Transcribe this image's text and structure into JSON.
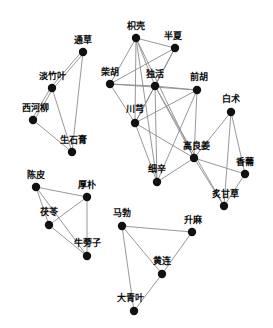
{
  "chart_data": {
    "type": "network-graph",
    "title": "",
    "xlabel": "",
    "ylabel": "",
    "grid": false,
    "legend": "none",
    "node_color": "#111111",
    "edge_color": "#8c8c8c",
    "background": "#ffffff",
    "node_radius": 4.2,
    "xlim": [
      0,
      273
    ],
    "ylim": [
      0,
      328
    ],
    "clusters": [
      {
        "name": "cluster-left-top",
        "members": [
          "通草",
          "淡竹叶",
          "西河柳",
          "生石膏"
        ]
      },
      {
        "name": "cluster-center-right",
        "members": [
          "枳壳",
          "半夏",
          "柴胡",
          "独活",
          "前胡",
          "川芎",
          "白术",
          "高良姜",
          "细辛",
          "香薷",
          "炙甘草"
        ]
      },
      {
        "name": "cluster-left-bottom",
        "members": [
          "陈皮",
          "厚朴",
          "茯苓",
          "牛蒡子"
        ]
      },
      {
        "name": "cluster-bottom-right",
        "members": [
          "马勃",
          "升麻",
          "黄连",
          "大青叶"
        ]
      }
    ],
    "nodes": [
      {
        "id": "tongcao",
        "label": "通草",
        "x": 83,
        "y": 52,
        "label_x": 83,
        "label_y": 45
      },
      {
        "id": "danzhuye",
        "label": "淡竹叶",
        "x": 52,
        "y": 88,
        "label_x": 52,
        "label_y": 81
      },
      {
        "id": "xiheliu",
        "label": "西河柳",
        "x": 33,
        "y": 120,
        "label_x": 35,
        "label_y": 113
      },
      {
        "id": "shengshigao",
        "label": "生石膏",
        "x": 72,
        "y": 152,
        "label_x": 73,
        "label_y": 145
      },
      {
        "id": "zhiqiao",
        "label": "枳壳",
        "x": 136,
        "y": 38,
        "label_x": 136,
        "label_y": 31
      },
      {
        "id": "banxia",
        "label": "半夏",
        "x": 175,
        "y": 48,
        "label_x": 173,
        "label_y": 41
      },
      {
        "id": "chaihu",
        "label": "柴胡",
        "x": 110,
        "y": 84,
        "label_x": 110,
        "label_y": 77
      },
      {
        "id": "duhuo",
        "label": "独活",
        "x": 155,
        "y": 86,
        "label_x": 155,
        "label_y": 79
      },
      {
        "id": "qianhu",
        "label": "前胡",
        "x": 197,
        "y": 90,
        "label_x": 199,
        "label_y": 82
      },
      {
        "id": "chuanxiong",
        "label": "川芎",
        "x": 135,
        "y": 123,
        "label_x": 135,
        "label_y": 114
      },
      {
        "id": "baizhu",
        "label": "白术",
        "x": 231,
        "y": 112,
        "label_x": 231,
        "label_y": 104
      },
      {
        "id": "gaoliangjiang",
        "label": "高良姜",
        "x": 194,
        "y": 158,
        "label_x": 196,
        "label_y": 151
      },
      {
        "id": "xixin",
        "label": "细辛",
        "x": 157,
        "y": 182,
        "label_x": 157,
        "label_y": 174
      },
      {
        "id": "xiangru",
        "label": "香薷",
        "x": 245,
        "y": 174,
        "label_x": 245,
        "label_y": 167
      },
      {
        "id": "zhigancao",
        "label": "炙甘草",
        "x": 224,
        "y": 206,
        "label_x": 225,
        "label_y": 199
      },
      {
        "id": "chenpi",
        "label": "陈皮",
        "x": 36,
        "y": 187,
        "label_x": 36,
        "label_y": 180
      },
      {
        "id": "houpo",
        "label": "厚朴",
        "x": 87,
        "y": 197,
        "label_x": 87,
        "label_y": 190
      },
      {
        "id": "fuling",
        "label": "茯苓",
        "x": 49,
        "y": 225,
        "label_x": 49,
        "label_y": 217
      },
      {
        "id": "niubangzi",
        "label": "牛蒡子",
        "x": 87,
        "y": 256,
        "label_x": 87,
        "label_y": 248
      },
      {
        "id": "mabo",
        "label": "马勃",
        "x": 122,
        "y": 226,
        "label_x": 122,
        "label_y": 218
      },
      {
        "id": "shengma",
        "label": "升麻",
        "x": 192,
        "y": 232,
        "label_x": 193,
        "label_y": 225
      },
      {
        "id": "huanglian",
        "label": "黄连",
        "x": 162,
        "y": 274,
        "label_x": 162,
        "label_y": 266
      },
      {
        "id": "daqingye",
        "label": "大青叶",
        "x": 134,
        "y": 311,
        "label_x": 130,
        "label_y": 303
      }
    ],
    "edges": [
      {
        "source": "tongcao",
        "target": "danzhuye",
        "double": true
      },
      {
        "source": "tongcao",
        "target": "shengshigao",
        "double": false
      },
      {
        "source": "danzhuye",
        "target": "xiheliu",
        "double": true
      },
      {
        "source": "danzhuye",
        "target": "shengshigao",
        "double": false
      },
      {
        "source": "xiheliu",
        "target": "shengshigao",
        "double": false
      },
      {
        "source": "zhiqiao",
        "target": "banxia",
        "double": false
      },
      {
        "source": "zhiqiao",
        "target": "chaihu",
        "double": false
      },
      {
        "source": "zhiqiao",
        "target": "duhuo",
        "double": false
      },
      {
        "source": "zhiqiao",
        "target": "chuanxiong",
        "double": false
      },
      {
        "source": "zhiqiao",
        "target": "xixin",
        "double": false
      },
      {
        "source": "zhiqiao",
        "target": "gaoliangjiang",
        "double": false
      },
      {
        "source": "banxia",
        "target": "chaihu",
        "double": false
      },
      {
        "source": "banxia",
        "target": "chuanxiong",
        "double": false
      },
      {
        "source": "banxia",
        "target": "duhuo",
        "double": false
      },
      {
        "source": "chaihu",
        "target": "duhuo",
        "double": false
      },
      {
        "source": "chaihu",
        "target": "chuanxiong",
        "double": false
      },
      {
        "source": "chaihu",
        "target": "qianhu",
        "double": false
      },
      {
        "source": "duhuo",
        "target": "qianhu",
        "double": false
      },
      {
        "source": "duhuo",
        "target": "chuanxiong",
        "double": false
      },
      {
        "source": "duhuo",
        "target": "xixin",
        "double": false
      },
      {
        "source": "duhuo",
        "target": "gaoliangjiang",
        "double": false
      },
      {
        "source": "duhuo",
        "target": "zhigancao",
        "double": false
      },
      {
        "source": "qianhu",
        "target": "chuanxiong",
        "double": false
      },
      {
        "source": "qianhu",
        "target": "xixin",
        "double": false
      },
      {
        "source": "qianhu",
        "target": "gaoliangjiang",
        "double": false
      },
      {
        "source": "chuanxiong",
        "target": "gaoliangjiang",
        "double": false
      },
      {
        "source": "chuanxiong",
        "target": "xixin",
        "double": false
      },
      {
        "source": "baizhu",
        "target": "gaoliangjiang",
        "double": false
      },
      {
        "source": "baizhu",
        "target": "xiangru",
        "double": false
      },
      {
        "source": "baizhu",
        "target": "zhigancao",
        "double": false
      },
      {
        "source": "gaoliangjiang",
        "target": "xixin",
        "double": false
      },
      {
        "source": "gaoliangjiang",
        "target": "xiangru",
        "double": false
      },
      {
        "source": "gaoliangjiang",
        "target": "zhigancao",
        "double": false
      },
      {
        "source": "xiangru",
        "target": "zhigancao",
        "double": false
      },
      {
        "source": "chenpi",
        "target": "houpo",
        "double": false
      },
      {
        "source": "chenpi",
        "target": "fuling",
        "double": false
      },
      {
        "source": "chenpi",
        "target": "niubangzi",
        "double": false
      },
      {
        "source": "houpo",
        "target": "fuling",
        "double": false
      },
      {
        "source": "houpo",
        "target": "niubangzi",
        "double": false
      },
      {
        "source": "fuling",
        "target": "niubangzi",
        "double": false
      },
      {
        "source": "mabo",
        "target": "shengma",
        "double": false
      },
      {
        "source": "mabo",
        "target": "huanglian",
        "double": false
      },
      {
        "source": "mabo",
        "target": "daqingye",
        "double": false
      },
      {
        "source": "shengma",
        "target": "huanglian",
        "double": false
      },
      {
        "source": "huanglian",
        "target": "daqingye",
        "double": false
      }
    ]
  }
}
